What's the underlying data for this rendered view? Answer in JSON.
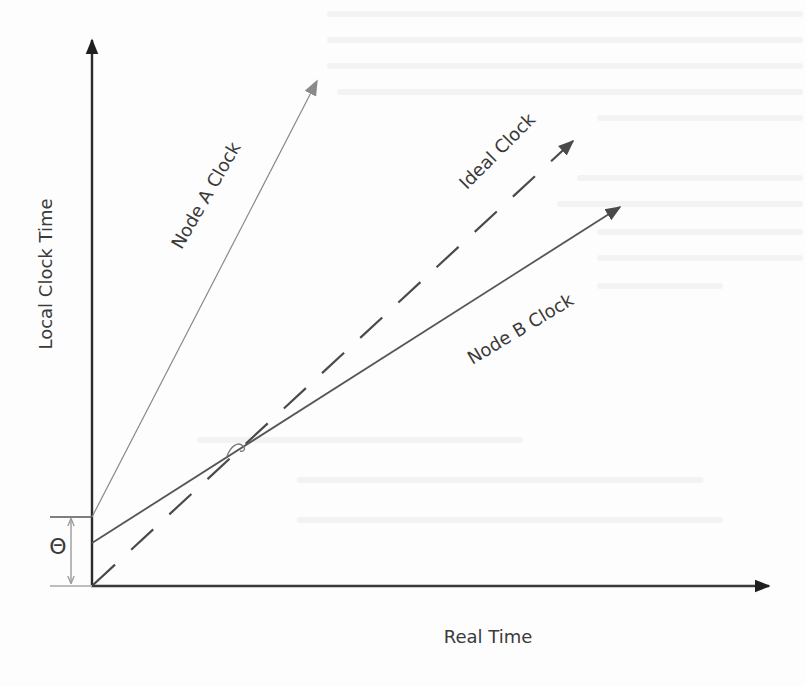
{
  "diagram": {
    "title": "",
    "axes": {
      "y_label": "Local Clock Time",
      "x_label": "Real Time"
    },
    "lines": [
      {
        "id": "node-a",
        "label": "Node A Clock",
        "style": "thin solid",
        "color": "#8a8a8a"
      },
      {
        "id": "ideal",
        "label": "Ideal Clock",
        "style": "dashed",
        "color": "#4a4a4a"
      },
      {
        "id": "node-b",
        "label": "Node B Clock",
        "style": "solid",
        "color": "#555555"
      }
    ],
    "offset_symbol": "Θ",
    "colors": {
      "axis": "#2b2b2b",
      "text": "#3a3a3a",
      "bracket": "#9a9a9a",
      "background": "#fdfdfd"
    }
  }
}
